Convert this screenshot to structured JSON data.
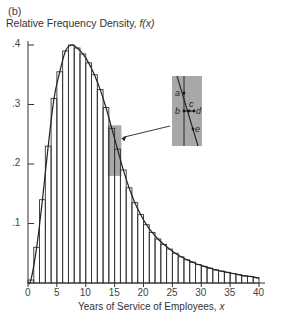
{
  "chart_data": {
    "type": "bar",
    "title": "",
    "panel_label": "(b)",
    "ylabel": "Relative Frequency Density, f(x)",
    "xlabel": "Years of Service of Employees, x",
    "xlim": [
      0,
      40
    ],
    "ylim": [
      0,
      0.4
    ],
    "grid": false,
    "x_ticks": [
      "0",
      "5",
      "10",
      "15",
      "20",
      "25",
      "30",
      "35",
      "40"
    ],
    "y_ticks": [
      ".1",
      ".2",
      ".3",
      ".4"
    ],
    "bin_width": 1,
    "bin_starts": [
      0,
      1,
      2,
      3,
      4,
      5,
      6,
      7,
      8,
      9,
      10,
      11,
      12,
      13,
      14,
      15,
      16,
      17,
      18,
      19,
      20,
      21,
      22,
      23,
      24,
      25,
      26,
      27,
      28,
      29,
      30,
      31,
      32,
      33,
      34,
      35,
      36,
      37,
      38,
      39
    ],
    "values": [
      0.005,
      0.06,
      0.14,
      0.23,
      0.31,
      0.355,
      0.39,
      0.4,
      0.395,
      0.385,
      0.37,
      0.35,
      0.325,
      0.295,
      0.26,
      0.225,
      0.19,
      0.16,
      0.135,
      0.115,
      0.098,
      0.085,
      0.074,
      0.065,
      0.057,
      0.05,
      0.044,
      0.039,
      0.035,
      0.031,
      0.028,
      0.025,
      0.022,
      0.02,
      0.018,
      0.016,
      0.014,
      0.012,
      0.011,
      0.009
    ],
    "overlay": "smooth density curve through histogram bar tops",
    "annotations": {
      "highlight_region": {
        "x_from": 14,
        "x_to": 16,
        "y_from": 0.18,
        "y_to": 0.265,
        "color": "#a8a8a8"
      },
      "inset": {
        "description": "magnified view of curve crossing bar edge",
        "points": [
          "a",
          "b",
          "c",
          "d",
          "e"
        ],
        "color": "#a8a8a8"
      }
    }
  }
}
